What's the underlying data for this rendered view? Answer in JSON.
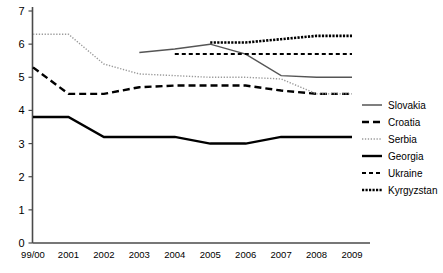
{
  "chart_data": {
    "type": "line",
    "title": "",
    "subtitle": "",
    "xlabel": "",
    "ylabel": "",
    "categories": [
      "99/00",
      "2001",
      "2002",
      "2003",
      "2004",
      "2005",
      "2006",
      "2007",
      "2008",
      "2009"
    ],
    "ylim": [
      0,
      7
    ],
    "yticks": [
      0,
      1,
      2,
      3,
      4,
      5,
      6,
      7
    ],
    "ytick_labels": [
      "0",
      "1",
      "2",
      "3",
      "4",
      "5",
      "6",
      "7"
    ],
    "grid": false,
    "legend_position": "right",
    "series": [
      {
        "name": "Slovakia",
        "style": "solid-thin",
        "color": "#555555",
        "values": [
          null,
          null,
          null,
          5.75,
          5.85,
          6.0,
          5.7,
          5.05,
          5.0,
          5.0
        ]
      },
      {
        "name": "Croatia",
        "style": "dashed",
        "color": "#000000",
        "values": [
          5.3,
          4.5,
          4.5,
          4.7,
          4.75,
          4.75,
          4.75,
          4.6,
          4.5,
          4.5
        ]
      },
      {
        "name": "Serbia",
        "style": "dotted-light",
        "color": "#999999",
        "values": [
          6.3,
          6.3,
          5.4,
          5.1,
          5.05,
          5.0,
          5.0,
          4.95,
          4.5,
          4.5
        ]
      },
      {
        "name": "Georgia",
        "style": "solid-thick",
        "color": "#000000",
        "values": [
          3.8,
          3.8,
          3.2,
          3.2,
          3.2,
          3.0,
          3.0,
          3.2,
          3.2,
          3.2
        ]
      },
      {
        "name": "Ukraine",
        "style": "short-dash",
        "color": "#000000",
        "values": [
          null,
          null,
          null,
          null,
          5.7,
          5.7,
          5.7,
          5.7,
          5.7,
          5.7
        ]
      },
      {
        "name": "Kyrgyzstan",
        "style": "dense-dot",
        "color": "#000000",
        "values": [
          null,
          null,
          null,
          null,
          null,
          6.05,
          6.05,
          6.15,
          6.25,
          6.25
        ]
      }
    ]
  },
  "legend": {
    "entries": [
      {
        "label": "Slovakia"
      },
      {
        "label": "Croatia"
      },
      {
        "label": "Serbia"
      },
      {
        "label": "Georgia"
      },
      {
        "label": "Ukraine"
      },
      {
        "label": "Kyrgyzstan"
      }
    ]
  }
}
